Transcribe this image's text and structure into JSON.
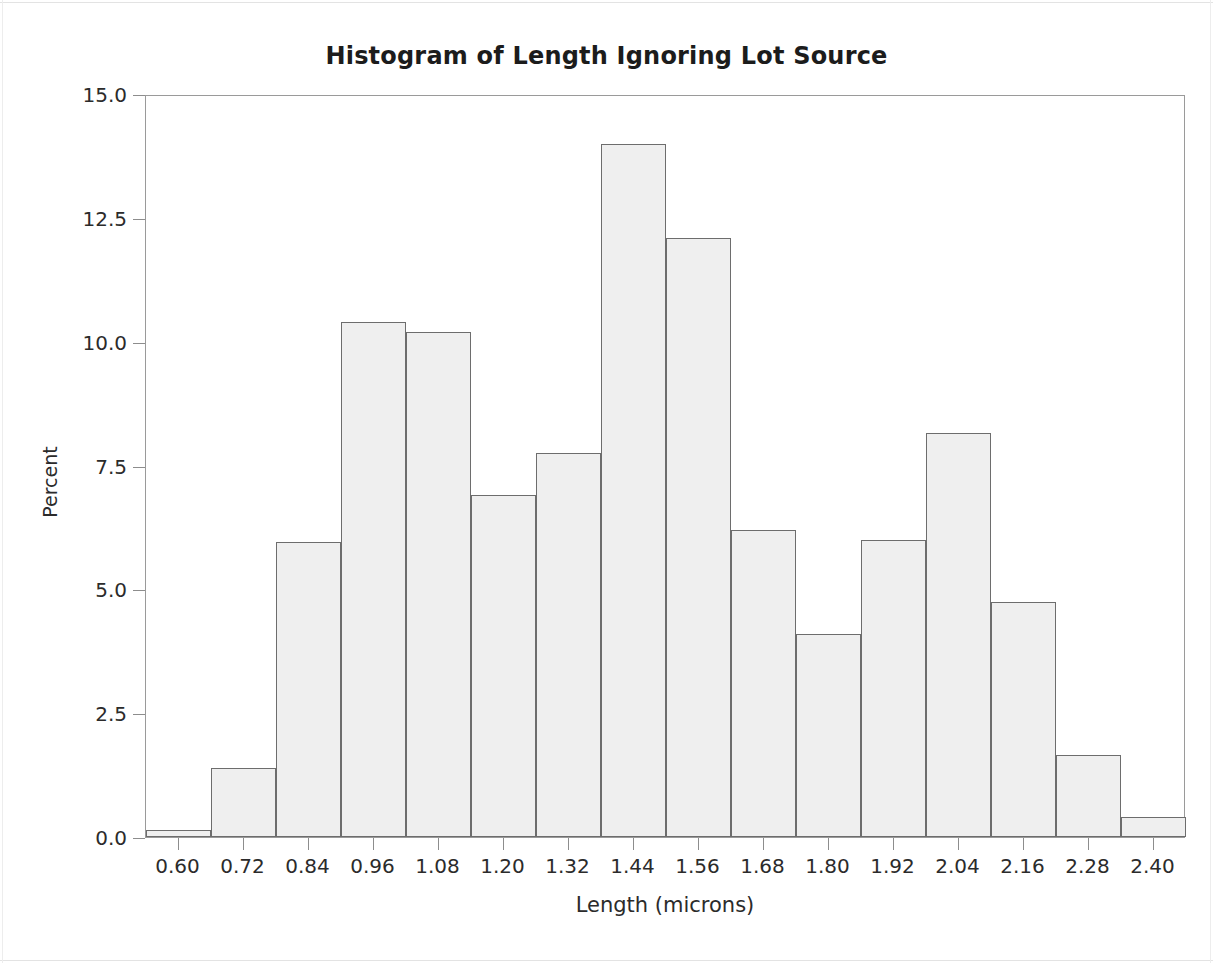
{
  "chart_data": {
    "type": "bar",
    "title": "Histogram of Length Ignoring Lot Source",
    "xlabel": "Length (microns)",
    "ylabel": "Percent",
    "grid": false,
    "legend": null,
    "xlim": [
      0.54,
      2.46
    ],
    "ylim": [
      0.0,
      15.0
    ],
    "bin_width": 0.12,
    "x_tick_labels": [
      "0.60",
      "0.72",
      "0.84",
      "0.96",
      "1.08",
      "1.20",
      "1.32",
      "1.44",
      "1.56",
      "1.68",
      "1.80",
      "1.92",
      "2.04",
      "2.16",
      "2.28",
      "2.40"
    ],
    "y_tick_labels": [
      "0.0",
      "2.5",
      "5.0",
      "7.5",
      "10.0",
      "12.5",
      "15.0"
    ],
    "y_tick_values": [
      0.0,
      2.5,
      5.0,
      7.5,
      10.0,
      12.5,
      15.0
    ],
    "categories": [
      0.6,
      0.72,
      0.84,
      0.96,
      1.08,
      1.2,
      1.32,
      1.44,
      1.56,
      1.68,
      1.8,
      1.92,
      2.04,
      2.16,
      2.28,
      2.4
    ],
    "values": [
      0.15,
      1.4,
      5.95,
      10.4,
      10.2,
      6.9,
      7.75,
      14.0,
      12.1,
      6.2,
      4.1,
      6.0,
      8.15,
      4.75,
      1.65,
      0.4
    ],
    "bar_fill_color": "#efefef",
    "bar_edge_color": "#6d6d6d",
    "axis_color": "#9a9a9a",
    "text_color": "#2b2b2b",
    "background_color": "#ffffff"
  }
}
